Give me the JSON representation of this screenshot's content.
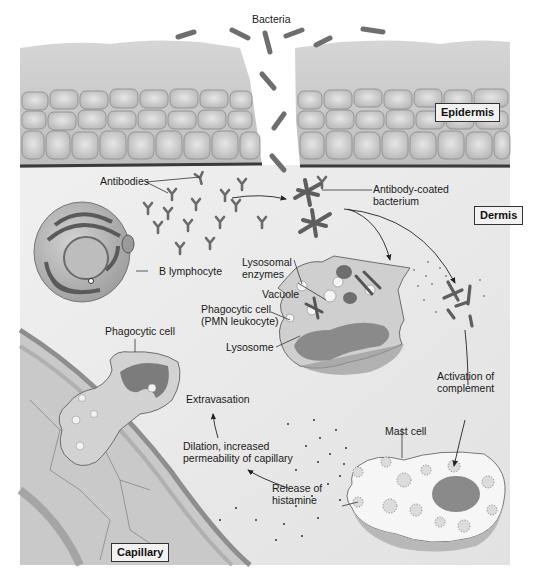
{
  "figure": {
    "colors": {
      "background": "#ffffff",
      "dermis": "#ececec",
      "epidermis_cell": "#d8d8d8",
      "stratum_corneum": "#c8c8c8",
      "bacteria": "#6e6e6e",
      "nucleus": "#7a7a7a",
      "cell_body": "#cfcfcf",
      "capillary": "#c6c6c6",
      "text": "#1a1a1a"
    }
  },
  "regions": {
    "epidermis": "Epidermis",
    "dermis": "Dermis",
    "capillary": "Capillary"
  },
  "labels": {
    "bacteria": "Bacteria",
    "antibodies": "Antibodies",
    "antibody_coated_1": "Antibody-coated",
    "antibody_coated_2": "bacterium",
    "b_lymphocyte": "B lymphocyte",
    "lysosomal_1": "Lysosomal",
    "lysosomal_2": "enzymes",
    "vacuole": "Vacuole",
    "phagocytic_pmn_1": "Phagocytic cell",
    "phagocytic_pmn_2": "(PMN leukocyte)",
    "lysosome": "Lysosome",
    "phagocytic_cell": "Phagocytic cell",
    "extravasation": "Extravasation",
    "dilation_1": "Dilation, increased",
    "dilation_2": "permeability of capillary",
    "activation_1": "Activation of",
    "activation_2": "complement",
    "mast_cell": "Mast cell",
    "histamine_1": "Release of",
    "histamine_2": "histamine"
  }
}
